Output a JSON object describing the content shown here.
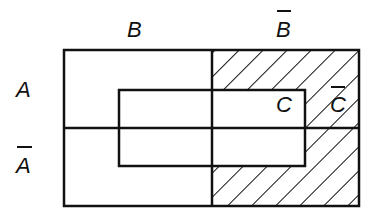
{
  "diagram": {
    "type": "karnaugh-style venn region diagram",
    "labels": {
      "B": "B",
      "B_bar": "B",
      "A": "A",
      "A_bar": "A",
      "C": "C",
      "C_bar": "C"
    },
    "overbar_labels": [
      "B_bar",
      "A_bar",
      "C_bar"
    ],
    "shaded_region": "B̄ ∩ C̄",
    "colors": {
      "line": "#111111",
      "background": "#ffffff",
      "hatch": "#111111"
    }
  }
}
